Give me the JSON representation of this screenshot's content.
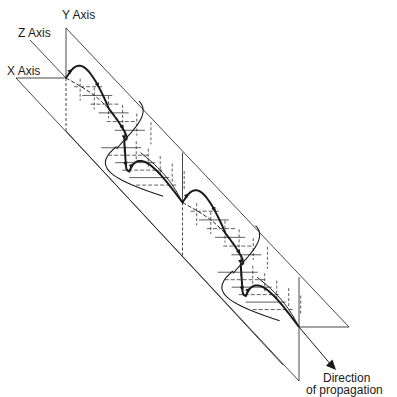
{
  "figure": {
    "labels": {
      "y_axis": "Y Axis",
      "z_axis": "Z Axis",
      "x_axis": "X Axis",
      "direction_line1": "Direction",
      "direction_line2": "of propagation"
    },
    "wave": {
      "periods_shown": 2,
      "components": [
        "vertical-plane component",
        "horizontal-plane component",
        "resultant helix"
      ],
      "arrowheads_per_period": 6
    },
    "colors": {
      "ink": "#1a1a1a",
      "background": "#ffffff"
    }
  }
}
